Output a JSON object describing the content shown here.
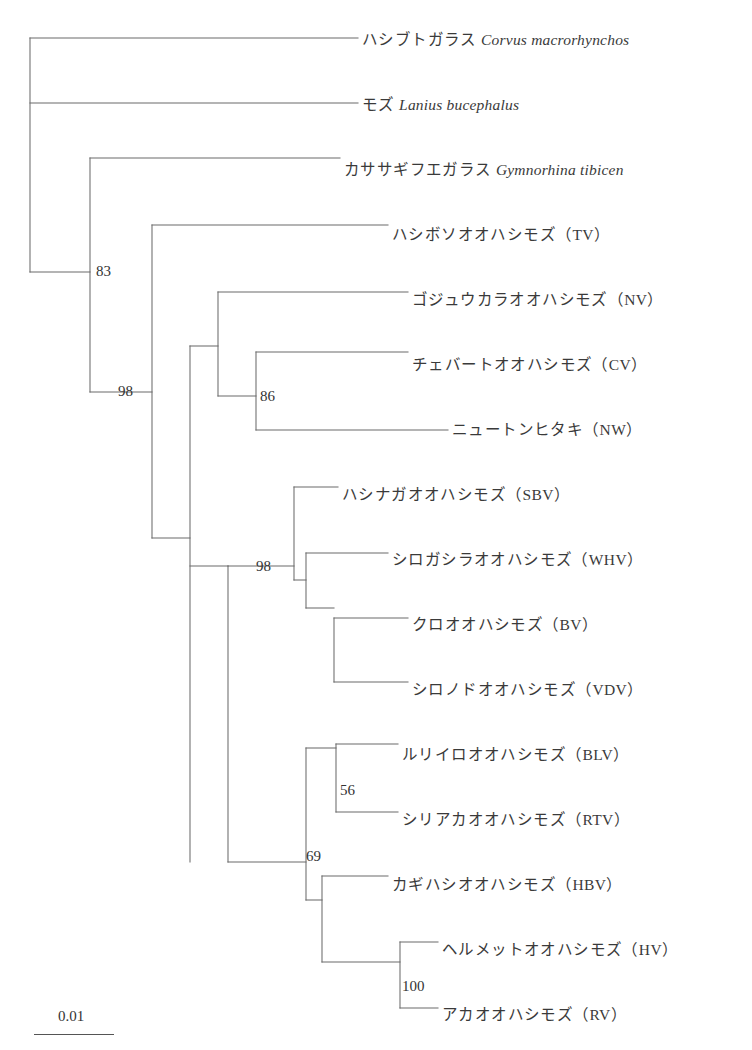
{
  "figure": {
    "type": "phylogenetic-tree",
    "scale_bar": {
      "label": "0.01",
      "length_px": 80
    }
  },
  "tips": [
    {
      "id": "corvus",
      "jp": "ハシブトガラス ",
      "sci": "Corvus macrorhynchos",
      "code": "",
      "y": 38,
      "branch_x": 358
    },
    {
      "id": "lanius",
      "jp": "モズ ",
      "sci": "Lanius bucephalus",
      "code": "",
      "y": 103,
      "branch_x": 358
    },
    {
      "id": "gymno",
      "jp": "カササギフエガラス ",
      "sci": "Gymnorhina tibicen",
      "code": "",
      "y": 168,
      "branch_x": 340
    },
    {
      "id": "tv",
      "jp": "ハシボソオオハシモズ（TV）",
      "sci": "",
      "code": "TV",
      "y": 233,
      "branch_x": 388
    },
    {
      "id": "nv",
      "jp": "ゴジュウカラオオハシモズ（NV）",
      "sci": "",
      "code": "NV",
      "y": 298,
      "branch_x": 408
    },
    {
      "id": "cv",
      "jp": "チェバートオオハシモズ（CV）",
      "sci": "",
      "code": "CV",
      "y": 363,
      "branch_x": 408
    },
    {
      "id": "nw",
      "jp": "ニュートンヒタキ（NW）",
      "sci": "",
      "code": "NW",
      "y": 428,
      "branch_x": 448
    },
    {
      "id": "sbv",
      "jp": "ハシナガオオハシモズ（SBV）",
      "sci": "",
      "code": "SBV",
      "y": 493,
      "branch_x": 338
    },
    {
      "id": "whv",
      "jp": "シロガシラオオハシモズ（WHV）",
      "sci": "",
      "code": "WHV",
      "y": 558,
      "branch_x": 388
    },
    {
      "id": "bv",
      "jp": "クロオオハシモズ（BV）",
      "sci": "",
      "code": "BV",
      "y": 623,
      "branch_x": 408
    },
    {
      "id": "vdv",
      "jp": "シロノドオオハシモズ（VDV）",
      "sci": "",
      "code": "VDV",
      "y": 688,
      "branch_x": 408
    },
    {
      "id": "blv",
      "jp": "ルリイロオオハシモズ（BLV）",
      "sci": "",
      "code": "BLV",
      "y": 753,
      "branch_x": 398
    },
    {
      "id": "rtv",
      "jp": "シリアカオオハシモズ（RTV）",
      "sci": "",
      "code": "RTV",
      "y": 818,
      "branch_x": 398
    },
    {
      "id": "hbv",
      "jp": "カギハシオオハシモズ（HBV）",
      "sci": "",
      "code": "HBV",
      "y": 883,
      "branch_x": 388
    },
    {
      "id": "hv",
      "jp": "ヘルメットオオハシモズ（HV）",
      "sci": "",
      "code": "HV",
      "y": 948,
      "branch_x": 438
    },
    {
      "id": "rv",
      "jp": "アカオオハシモズ（RV）",
      "sci": "",
      "code": "RV",
      "y": 1013,
      "branch_x": 438
    }
  ],
  "bootstrap": [
    {
      "id": "b83",
      "value": "83",
      "x": 96,
      "y": 271
    },
    {
      "id": "b98a",
      "value": "98",
      "x": 118,
      "y": 391
    },
    {
      "id": "b86",
      "value": "86",
      "x": 260,
      "y": 396
    },
    {
      "id": "b98b",
      "value": "98",
      "x": 256,
      "y": 566
    },
    {
      "id": "b56",
      "value": "56",
      "x": 340,
      "y": 790
    },
    {
      "id": "b69",
      "value": "69",
      "x": 306,
      "y": 856
    },
    {
      "id": "b100",
      "value": "100",
      "x": 402,
      "y": 986
    }
  ],
  "branches": [
    {
      "name": "root-vertical",
      "x1": 30,
      "y1": 38,
      "x2": 30,
      "y2": 272
    },
    {
      "name": "corvus-branch",
      "x1": 30,
      "y1": 38,
      "x2": 358,
      "y2": 38
    },
    {
      "name": "lanius-branch",
      "x1": 30,
      "y1": 103,
      "x2": 358,
      "y2": 103
    },
    {
      "name": "node83-connector",
      "x1": 30,
      "y1": 272,
      "x2": 90,
      "y2": 272
    },
    {
      "name": "node83-vertical",
      "x1": 90,
      "y1": 158,
      "x2": 90,
      "y2": 392
    },
    {
      "name": "gymnorhina-branch",
      "x1": 90,
      "y1": 158,
      "x2": 340,
      "y2": 158
    },
    {
      "name": "node98a-connector",
      "x1": 90,
      "y1": 392,
      "x2": 152,
      "y2": 392
    },
    {
      "name": "node98a-vertical",
      "x1": 152,
      "y1": 225,
      "x2": 152,
      "y2": 538
    },
    {
      "name": "tv-branch",
      "x1": 152,
      "y1": 225,
      "x2": 388,
      "y2": 225
    },
    {
      "name": "vangidae-connector",
      "x1": 152,
      "y1": 538,
      "x2": 190,
      "y2": 538
    },
    {
      "name": "vangidae-vertical",
      "x1": 190,
      "y1": 346,
      "x2": 190,
      "y2": 862
    },
    {
      "name": "clade1-connector",
      "x1": 190,
      "y1": 346,
      "x2": 218,
      "y2": 346
    },
    {
      "name": "clade1-vertical",
      "x1": 218,
      "y1": 292,
      "x2": 218,
      "y2": 396
    },
    {
      "name": "nv-branch",
      "x1": 218,
      "y1": 292,
      "x2": 408,
      "y2": 292
    },
    {
      "name": "node86-connector",
      "x1": 218,
      "y1": 396,
      "x2": 256,
      "y2": 396
    },
    {
      "name": "node86-vertical",
      "x1": 256,
      "y1": 352,
      "x2": 256,
      "y2": 430
    },
    {
      "name": "cv-branch",
      "x1": 256,
      "y1": 352,
      "x2": 408,
      "y2": 352
    },
    {
      "name": "nw-branch",
      "x1": 256,
      "y1": 430,
      "x2": 448,
      "y2": 430
    },
    {
      "name": "clade2-vertical",
      "x1": 228,
      "y1": 566,
      "x2": 228,
      "y2": 862
    },
    {
      "name": "clade2-connector",
      "x1": 190,
      "y1": 566,
      "x2": 228,
      "y2": 566
    },
    {
      "name": "node98b-connector",
      "x1": 228,
      "y1": 566,
      "x2": 294,
      "y2": 566
    },
    {
      "name": "node98b-vertical",
      "x1": 294,
      "y1": 487,
      "x2": 294,
      "y2": 580
    },
    {
      "name": "sbv-branch",
      "x1": 294,
      "y1": 487,
      "x2": 338,
      "y2": 487
    },
    {
      "name": "whv-sub-connector",
      "x1": 294,
      "y1": 580,
      "x2": 306,
      "y2": 580
    },
    {
      "name": "whv-sub-vertical",
      "x1": 306,
      "y1": 553,
      "x2": 306,
      "y2": 608
    },
    {
      "name": "whv-branch",
      "x1": 306,
      "y1": 553,
      "x2": 388,
      "y2": 553
    },
    {
      "name": "bv-vdv-connector",
      "x1": 306,
      "y1": 608,
      "x2": 334,
      "y2": 608
    },
    {
      "name": "bv-vdv-vertical",
      "x1": 334,
      "y1": 618,
      "x2": 334,
      "y2": 682
    },
    {
      "name": "bv-branch",
      "x1": 334,
      "y1": 618,
      "x2": 408,
      "y2": 618
    },
    {
      "name": "vdv-branch",
      "x1": 334,
      "y1": 682,
      "x2": 408,
      "y2": 682
    },
    {
      "name": "node69-connector",
      "x1": 228,
      "y1": 862,
      "x2": 306,
      "y2": 862
    },
    {
      "name": "node69-vertical",
      "x1": 306,
      "y1": 748,
      "x2": 306,
      "y2": 900
    },
    {
      "name": "node56-connector",
      "x1": 306,
      "y1": 748,
      "x2": 336,
      "y2": 748
    },
    {
      "name": "node56-vertical",
      "x1": 336,
      "y1": 744,
      "x2": 336,
      "y2": 812
    },
    {
      "name": "blv-branch",
      "x1": 336,
      "y1": 744,
      "x2": 398,
      "y2": 744
    },
    {
      "name": "rtv-branch",
      "x1": 336,
      "y1": 812,
      "x2": 398,
      "y2": 812
    },
    {
      "name": "hbv-clade-connector",
      "x1": 306,
      "y1": 900,
      "x2": 322,
      "y2": 900
    },
    {
      "name": "hbv-clade-vertical",
      "x1": 322,
      "y1": 876,
      "x2": 322,
      "y2": 962
    },
    {
      "name": "hbv-branch",
      "x1": 322,
      "y1": 876,
      "x2": 388,
      "y2": 876
    },
    {
      "name": "node100-connector",
      "x1": 322,
      "y1": 962,
      "x2": 400,
      "y2": 962
    },
    {
      "name": "node100-vertical",
      "x1": 400,
      "y1": 942,
      "x2": 400,
      "y2": 1008
    },
    {
      "name": "hv-branch",
      "x1": 400,
      "y1": 942,
      "x2": 438,
      "y2": 942
    },
    {
      "name": "rv-branch",
      "x1": 400,
      "y1": 1008,
      "x2": 438,
      "y2": 1008
    }
  ]
}
